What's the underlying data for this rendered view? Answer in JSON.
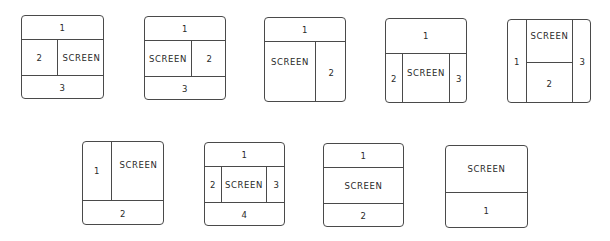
{
  "layouts": [
    {
      "id": 1,
      "regions": {
        "top": "1",
        "left": "2",
        "right": "SCREEN",
        "bottom": "3"
      }
    },
    {
      "id": 2,
      "regions": {
        "top": "1",
        "left": "SCREEN",
        "right": "2",
        "bottom": "3"
      }
    },
    {
      "id": 3,
      "regions": {
        "top": "1",
        "left": "SCREEN",
        "right": "2"
      }
    },
    {
      "id": 4,
      "regions": {
        "top": "1",
        "left": "2",
        "center": "SCREEN",
        "right": "3"
      }
    },
    {
      "id": 5,
      "regions": {
        "left": "1",
        "center_top": "SCREEN",
        "center_bottom": "2",
        "right": "3"
      }
    },
    {
      "id": 6,
      "regions": {
        "left": "1",
        "right": "SCREEN",
        "bottom": "2"
      }
    },
    {
      "id": 7,
      "regions": {
        "top": "1",
        "left": "2",
        "center": "SCREEN",
        "right": "3",
        "bottom": "4"
      }
    },
    {
      "id": 8,
      "regions": {
        "top": "1",
        "middle": "SCREEN",
        "bottom": "2"
      }
    },
    {
      "id": 9,
      "regions": {
        "top": "SCREEN",
        "bottom": "1"
      }
    }
  ]
}
